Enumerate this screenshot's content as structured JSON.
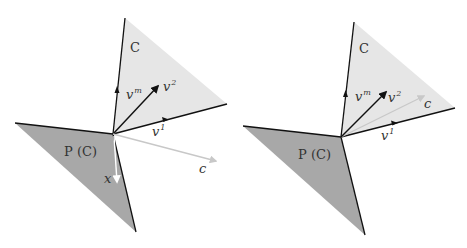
{
  "colors": {
    "cone_fill": "#e6e6e6",
    "polar_fill": "#a8a8a8",
    "edge": "#111111",
    "c_arrow": "#c8c8c8",
    "x_arrow": "#ffffff",
    "text": "#333333"
  },
  "panels": [
    {
      "id": "left",
      "labels": {
        "cone": "C",
        "polar_cone": "P (C)",
        "vm_base": "v",
        "vm_sup": "m",
        "v2_base": "v",
        "v2_sup": "2",
        "v1_base": "v",
        "v1_sup": "1",
        "c": "c",
        "x": "x"
      },
      "description": "Cone C with generators v1, v2, vm; vector c pointing outside C (below); polar cone P(C) with vector x"
    },
    {
      "id": "right",
      "labels": {
        "cone": "C",
        "polar_cone": "P (C)",
        "vm_base": "v",
        "vm_sup": "m",
        "v2_base": "v",
        "v2_sup": "2",
        "v1_base": "v",
        "v1_sup": "1",
        "c": "c"
      },
      "description": "Cone C with generators v1, v2, vm; vector c lying inside C; polar cone P(C)"
    }
  ]
}
